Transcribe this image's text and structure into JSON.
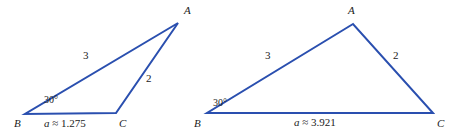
{
  "figure": {
    "stroke_color": "#2a4faf",
    "text_color": "#1b1b1b",
    "background_color": "#ffffff",
    "stroke_width": 2
  },
  "triangles": [
    {
      "id": "left-triangle",
      "vertices": {
        "A": {
          "label": "A",
          "x": 178,
          "y": 23,
          "label_x": 184,
          "label_y": 5
        },
        "B": {
          "label": "B",
          "x": 25,
          "y": 114,
          "label_x": 14,
          "label_y": 118
        },
        "C": {
          "label": "C",
          "x": 116,
          "y": 113,
          "label_x": 119,
          "label_y": 118
        }
      },
      "sides": {
        "c": {
          "label": "3",
          "x": 83,
          "y": 50
        },
        "b": {
          "label": "2",
          "x": 146,
          "y": 73
        }
      },
      "angle": {
        "label": "30°",
        "x": 44,
        "y": 95
      },
      "base": {
        "var": "a",
        "relation": "≈",
        "value": "1.275",
        "x": 44,
        "y": 118
      }
    },
    {
      "id": "right-triangle",
      "vertices": {
        "A": {
          "label": "A",
          "x": 353,
          "y": 24,
          "label_x": 348,
          "label_y": 5
        },
        "B": {
          "label": "B",
          "x": 207,
          "y": 113,
          "label_x": 194,
          "label_y": 118
        },
        "C": {
          "label": "C",
          "x": 433,
          "y": 113,
          "label_x": 437,
          "label_y": 118
        }
      },
      "sides": {
        "c": {
          "label": "3",
          "x": 265,
          "y": 50
        },
        "b": {
          "label": "2",
          "x": 393,
          "y": 50
        }
      },
      "angle": {
        "label": "30°",
        "x": 213,
        "y": 98
      },
      "base": {
        "var": "a",
        "relation": "≈",
        "value": "3.921",
        "x": 294,
        "y": 117
      }
    }
  ]
}
